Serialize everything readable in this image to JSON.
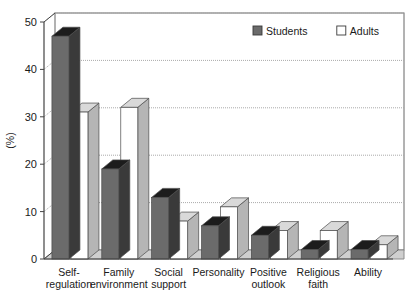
{
  "chart_data": {
    "type": "bar",
    "title": "",
    "subtitle": "",
    "xlabel": "",
    "ylabel": "(%)",
    "ylim": [
      0,
      50
    ],
    "yticks": [
      0,
      10,
      20,
      30,
      40,
      50
    ],
    "ytick_labels": [
      "0",
      "10",
      "20",
      "30",
      "40",
      "50"
    ],
    "grid": true,
    "grid_axis": "y",
    "legend_position": "top-right",
    "style": "3d-grouped-bars",
    "categories": [
      "Self-\nregulation",
      "Family\nenvironment",
      "Social\nsupport",
      "Personality",
      "Positive\noutlook",
      "Religious\nfaith",
      "Ability"
    ],
    "category_lines": [
      [
        "Self-",
        "regulation"
      ],
      [
        "Family",
        "environment"
      ],
      [
        "Social",
        "support"
      ],
      [
        "Personality",
        ""
      ],
      [
        "Positive",
        "outlook"
      ],
      [
        "Religious",
        "faith"
      ],
      [
        "Ability",
        ""
      ]
    ],
    "series": [
      {
        "name": "Students",
        "color": "#6b6b6b",
        "top_color": "#1c1c1c",
        "side_color": "#3a3a3a",
        "values": [
          47,
          19,
          13,
          7,
          5,
          2,
          2
        ]
      },
      {
        "name": "Adults",
        "color": "#ffffff",
        "top_color": "#d9d9d9",
        "side_color": "#b5b5b5",
        "values": [
          31,
          32,
          8,
          11,
          6,
          6,
          3
        ]
      }
    ]
  },
  "legend": {
    "items": [
      {
        "label": "Students",
        "swatch": "#6b6b6b"
      },
      {
        "label": "Adults",
        "swatch": "#ffffff"
      }
    ]
  },
  "axis": {
    "y_title": "(%)"
  },
  "colors": {
    "axis_line": "#444444",
    "grid_line": "#aaaaaa",
    "floor": "#cfcfcf",
    "floor_edge": "#8a8a8a",
    "text": "#1a1a1a",
    "plot_border": "#666666"
  }
}
